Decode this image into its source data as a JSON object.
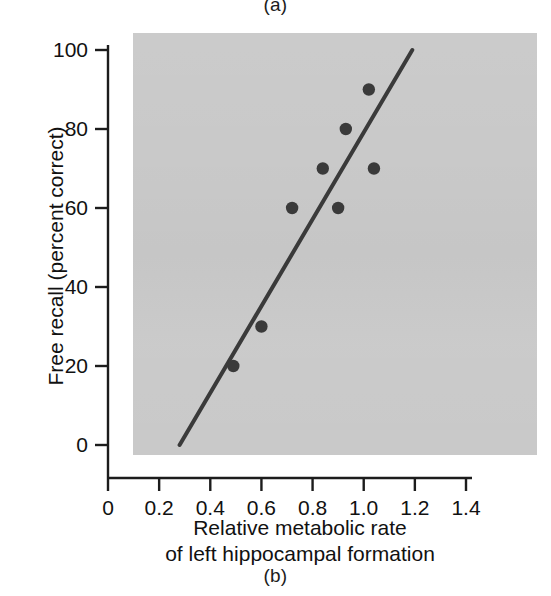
{
  "figure": {
    "caption_top": "(a)",
    "caption_bottom": "(b)"
  },
  "chart_data": {
    "type": "scatter",
    "title": "",
    "xlabel": "Relative metabolic rate of left hippocampal formation",
    "xlabel_line1": "Relative metabolic rate",
    "xlabel_line2": "of left hippocampal formation",
    "ylabel": "Free recall (percent correct)",
    "xlim": [
      0,
      1.4
    ],
    "ylim": [
      0,
      100
    ],
    "xticks": [
      0,
      0.2,
      0.4,
      0.6,
      0.8,
      1.0,
      1.2,
      1.4
    ],
    "xtick_labels": [
      "0",
      "0.2",
      "0.4",
      "0.6",
      "0.8",
      "1.0",
      "1.2",
      "1.4"
    ],
    "yticks": [
      0,
      20,
      40,
      60,
      80,
      100
    ],
    "ytick_labels": [
      "0",
      "20",
      "40",
      "60",
      "80",
      "100"
    ],
    "grid": false,
    "legend": false,
    "plot_background": "#c9c9c9",
    "marker_color": "#3a3a3a",
    "line_color": "#3a3a3a",
    "points": [
      {
        "x": 0.49,
        "y": 20
      },
      {
        "x": 0.6,
        "y": 30
      },
      {
        "x": 0.72,
        "y": 60
      },
      {
        "x": 0.84,
        "y": 70
      },
      {
        "x": 0.9,
        "y": 60
      },
      {
        "x": 0.93,
        "y": 80
      },
      {
        "x": 1.02,
        "y": 90
      },
      {
        "x": 1.04,
        "y": 70
      }
    ],
    "fit_line": {
      "x_start": 0.28,
      "y_start": 0,
      "x_end": 1.19,
      "y_end": 100
    }
  }
}
